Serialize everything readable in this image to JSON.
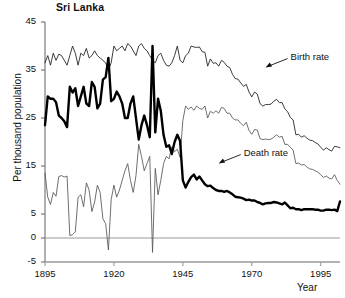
{
  "chart_data": {
    "type": "line",
    "title": "Sri Lanka",
    "xlabel": "Year",
    "ylabel": "Per thousand population",
    "xlim": [
      1895,
      2002
    ],
    "ylim": [
      -5,
      45
    ],
    "grid": false,
    "legend_position": "inline-annotations",
    "xticks": [
      1895,
      1920,
      1945,
      1970,
      1995
    ],
    "yticks": [
      -5,
      0,
      5,
      15,
      25,
      35,
      45
    ],
    "zero_line": 0,
    "annotations": [
      {
        "text": "Birth rate",
        "year": 1975,
        "value": 35.5,
        "arrow": "down-left"
      },
      {
        "text": "Death rate",
        "year": 1958,
        "value": 15.5,
        "arrow": "down-left"
      }
    ],
    "x": [
      1895,
      1896,
      1897,
      1898,
      1899,
      1900,
      1901,
      1902,
      1903,
      1904,
      1905,
      1906,
      1907,
      1908,
      1909,
      1910,
      1911,
      1912,
      1913,
      1914,
      1915,
      1916,
      1917,
      1918,
      1919,
      1920,
      1921,
      1922,
      1923,
      1924,
      1925,
      1926,
      1927,
      1928,
      1929,
      1930,
      1931,
      1932,
      1933,
      1934,
      1935,
      1936,
      1937,
      1938,
      1939,
      1940,
      1941,
      1942,
      1943,
      1944,
      1945,
      1946,
      1947,
      1948,
      1949,
      1950,
      1951,
      1952,
      1953,
      1954,
      1955,
      1956,
      1957,
      1958,
      1959,
      1960,
      1961,
      1962,
      1963,
      1964,
      1965,
      1966,
      1967,
      1968,
      1969,
      1970,
      1971,
      1972,
      1973,
      1974,
      1975,
      1976,
      1977,
      1978,
      1979,
      1980,
      1981,
      1982,
      1983,
      1984,
      1985,
      1986,
      1987,
      1988,
      1989,
      1990,
      1991,
      1992,
      1993,
      1994,
      1995,
      1996,
      1997,
      1998,
      1999,
      2000,
      2001,
      2002
    ],
    "series": [
      {
        "name": "Birth rate",
        "style": "thin",
        "color": "#1a1a1a",
        "values": [
          36.5,
          38.0,
          36.0,
          38.5,
          37.0,
          38.3,
          38.0,
          37.0,
          36.0,
          38.0,
          40.0,
          38.5,
          36.0,
          38.5,
          38.0,
          39.5,
          37.5,
          38.0,
          39.0,
          38.0,
          37.5,
          37.0,
          36.5,
          35.0,
          36.5,
          40.0,
          39.0,
          39.5,
          40.0,
          39.0,
          40.5,
          40.0,
          39.0,
          38.0,
          40.0,
          40.5,
          39.5,
          39.0,
          38.0,
          37.0,
          36.5,
          38.0,
          38.5,
          37.0,
          36.0,
          35.8,
          36.5,
          38.0,
          40.0,
          37.0,
          36.5,
          38.0,
          38.5,
          40.0,
          39.8,
          39.7,
          39.8,
          38.8,
          38.7,
          35.8,
          37.3,
          36.4,
          36.5,
          35.8,
          37.0,
          36.6,
          35.8,
          35.5,
          34.1,
          33.2,
          33.1,
          32.3,
          31.6,
          32.0,
          30.4,
          29.4,
          30.4,
          30.0,
          28.0,
          27.5,
          27.8,
          27.8,
          27.9,
          28.5,
          28.9,
          28.2,
          28.2,
          26.9,
          26.3,
          25.1,
          24.6,
          21.5,
          21.6,
          21.0,
          21.3,
          20.8,
          20.4,
          20.3,
          19.9,
          19.6,
          18.9,
          18.3,
          18.8,
          18.4,
          18.1,
          19.1,
          19.0,
          18.8
        ]
      },
      {
        "name": "Natural increase",
        "style": "thin",
        "color": "#555555",
        "values": [
          13.5,
          8.5,
          7.0,
          9.5,
          8.7,
          12.8,
          13.0,
          12.7,
          12.9,
          0.5,
          0.7,
          1.3,
          8.5,
          9.0,
          6.5,
          11.5,
          10.0,
          5.5,
          7.5,
          11.0,
          9.5,
          4.0,
          3.0,
          -2.5,
          8.0,
          11.0,
          8.5,
          10.0,
          12.0,
          14.0,
          15.5,
          12.0,
          9.5,
          13.0,
          19.5,
          17.0,
          14.0,
          15.5,
          17.0,
          -3.0,
          14.5,
          9.0,
          12.0,
          15.5,
          17.0,
          16.5,
          19.0,
          18.0,
          18.5,
          16.8,
          24.5,
          27.5,
          26.8,
          27.3,
          26.6,
          27.5,
          27.0,
          26.8,
          27.5,
          25.0,
          26.4,
          26.0,
          26.5,
          26.0,
          27.2,
          27.0,
          26.0,
          26.0,
          25.0,
          24.6,
          24.6,
          23.9,
          23.4,
          24.1,
          22.4,
          21.6,
          22.6,
          22.5,
          20.7,
          20.5,
          20.6,
          20.5,
          20.6,
          21.0,
          21.5,
          21.0,
          21.2,
          19.5,
          19.5,
          18.9,
          18.3,
          15.5,
          15.6,
          15.2,
          15.3,
          14.8,
          14.4,
          14.3,
          14.0,
          13.7,
          13.2,
          12.6,
          12.9,
          12.5,
          12.3,
          13.2,
          12.0,
          11.2
        ]
      },
      {
        "name": "Death rate",
        "style": "thick",
        "color": "#000000",
        "values": [
          23.5,
          29.5,
          29.0,
          29.0,
          28.3,
          25.5,
          25.0,
          24.3,
          23.1,
          31.5,
          30.3,
          31.2,
          27.5,
          29.5,
          31.5,
          28.0,
          27.5,
          32.5,
          31.5,
          27.0,
          28.0,
          33.0,
          33.5,
          37.5,
          28.5,
          29.0,
          30.5,
          29.5,
          28.0,
          25.0,
          25.0,
          28.0,
          29.5,
          25.0,
          20.5,
          23.5,
          25.5,
          23.5,
          21.0,
          40.0,
          22.0,
          29.0,
          26.5,
          21.5,
          19.0,
          19.3,
          17.5,
          20.0,
          21.5,
          20.2,
          12.0,
          10.5,
          11.7,
          12.7,
          13.2,
          12.2,
          12.8,
          12.0,
          11.2,
          10.8,
          10.9,
          10.4,
          10.0,
          9.8,
          9.8,
          9.6,
          9.8,
          9.5,
          9.1,
          8.6,
          8.5,
          8.4,
          8.2,
          7.9,
          8.0,
          7.8,
          7.8,
          7.5,
          7.3,
          7.0,
          7.2,
          7.3,
          7.3,
          7.5,
          7.4,
          7.2,
          7.0,
          7.4,
          6.8,
          6.2,
          6.3,
          6.0,
          6.0,
          5.8,
          6.0,
          6.0,
          6.0,
          6.0,
          5.9,
          5.9,
          5.7,
          5.7,
          5.9,
          5.9,
          5.8,
          5.9,
          5.6,
          7.6
        ]
      }
    ]
  }
}
